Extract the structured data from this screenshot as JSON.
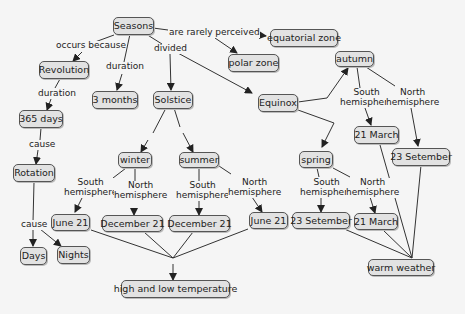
{
  "nodes": {
    "seasons": "Seasons",
    "equatorial_zone": "equatorial zone",
    "polar_zone": "polar zone",
    "revolution": "Revolution",
    "three_months": "3 months",
    "solstice": "Solstice",
    "equinox": "Equinox",
    "autumn": "autumn",
    "days_365": "365 days",
    "rotation": "Rotation",
    "winter": "winter",
    "summer": "summer",
    "spring": "spring",
    "march21_autumn": "21 March",
    "sep23_autumn": "23 Setember",
    "june21_winter": "June 21",
    "dec21_winter": "December 21",
    "dec21_summer": "December 21",
    "june21_summer": "June 21",
    "sep23_spring": "23 Setember",
    "march21_spring": "21 March",
    "days": "Days",
    "nights": "Nights",
    "high_low_temp": "high and low temperature",
    "warm_weather": "warm weather"
  },
  "links": {
    "occurs_because": "occurs because",
    "duration1": "duration",
    "divided": "divided",
    "rarely_perceived": "are rarely perceived",
    "duration2": "duration",
    "cause1": "cause",
    "cause2": "cause",
    "south_hemi": "South\nhemisphere",
    "north_hemi": "North\nhemisphere"
  }
}
